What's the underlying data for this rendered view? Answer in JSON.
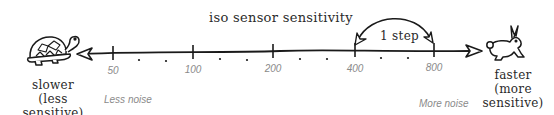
{
  "diagram": {
    "title": "iso sensor sensitivity",
    "step_annotation": "1 step",
    "axis": {
      "ticks": [
        {
          "label": "50",
          "x": 113
        },
        {
          "label": "100",
          "x": 193
        },
        {
          "label": "200",
          "x": 273
        },
        {
          "label": "400",
          "x": 355
        },
        {
          "label": "800",
          "x": 434
        }
      ],
      "minor_dots_between_ticks": 2
    },
    "left": {
      "icon": "turtle-icon",
      "label_line1": "slower",
      "label_line2": "(less sensitive)",
      "noise_label": "Less noise"
    },
    "right": {
      "icon": "rabbit-icon",
      "label_line1": "faster",
      "label_line2": "(more",
      "label_line3": "sensitive)",
      "noise_label": "More noise"
    },
    "colors": {
      "ink": "#1a1a1a",
      "muted_text": "#8a8a8a"
    }
  }
}
